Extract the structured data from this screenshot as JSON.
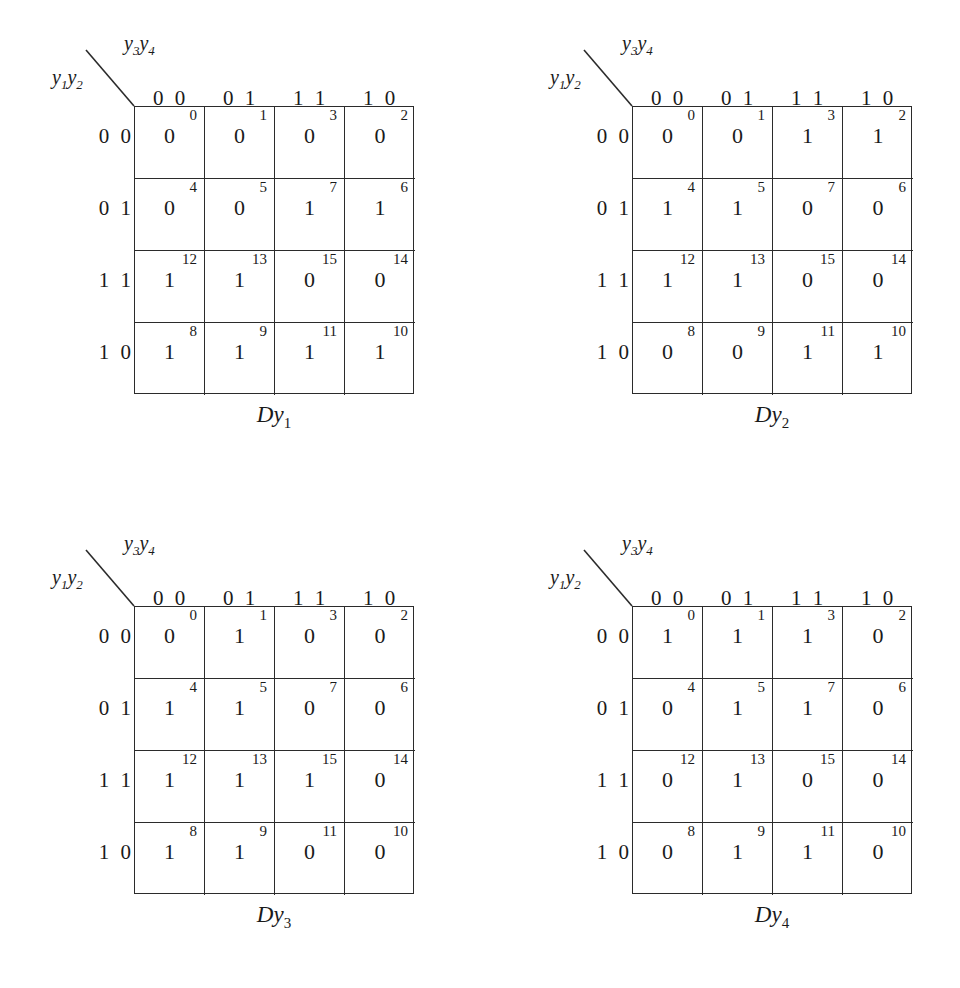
{
  "figure": {
    "type": "karnaugh-map-set",
    "map_count": 4,
    "row_var_label_html": "y<sub>1</sub>y<sub>2</sub>",
    "col_var_label_html": "y<sub>3</sub>y<sub>4</sub>",
    "column_headers": [
      "0 0",
      "0 1",
      "1 1",
      "1 0"
    ],
    "row_headers": [
      "0 0",
      "0 1",
      "1 1",
      "1 0"
    ],
    "cell_indices": [
      [
        0,
        1,
        3,
        2
      ],
      [
        4,
        5,
        7,
        6
      ],
      [
        12,
        13,
        15,
        14
      ],
      [
        8,
        9,
        11,
        10
      ]
    ],
    "line_color": "#2b2b2b",
    "text_color": "#1a1a1a",
    "background": "#ffffff"
  },
  "maps": [
    {
      "caption_main": "Dy",
      "caption_sub": "1",
      "values": [
        [
          "0",
          "0",
          "0",
          "0"
        ],
        [
          "0",
          "0",
          "1",
          "1"
        ],
        [
          "1",
          "1",
          "0",
          "0"
        ],
        [
          "1",
          "1",
          "1",
          "1"
        ]
      ]
    },
    {
      "caption_main": "Dy",
      "caption_sub": "2",
      "values": [
        [
          "0",
          "0",
          "1",
          "1"
        ],
        [
          "1",
          "1",
          "0",
          "0"
        ],
        [
          "1",
          "1",
          "0",
          "0"
        ],
        [
          "0",
          "0",
          "1",
          "1"
        ]
      ]
    },
    {
      "caption_main": "Dy",
      "caption_sub": "3",
      "values": [
        [
          "0",
          "1",
          "0",
          "0"
        ],
        [
          "1",
          "1",
          "0",
          "0"
        ],
        [
          "1",
          "1",
          "1",
          "0"
        ],
        [
          "1",
          "1",
          "0",
          "0"
        ]
      ]
    },
    {
      "caption_main": "Dy",
      "caption_sub": "4",
      "values": [
        [
          "1",
          "1",
          "1",
          "0"
        ],
        [
          "0",
          "1",
          "1",
          "0"
        ],
        [
          "0",
          "1",
          "0",
          "0"
        ],
        [
          "0",
          "1",
          "1",
          "0"
        ]
      ]
    }
  ]
}
